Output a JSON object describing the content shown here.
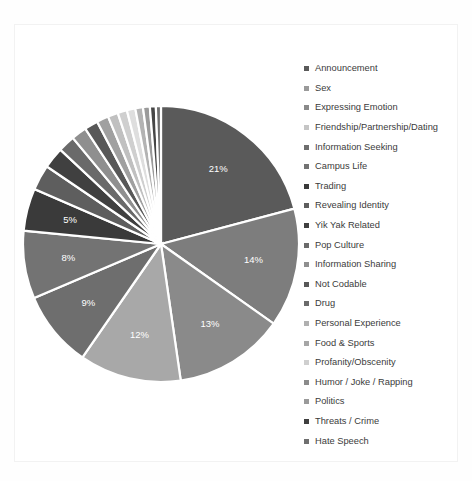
{
  "chart_data": {
    "type": "pie",
    "title": "",
    "xlabel": "",
    "ylabel": "",
    "legend_position": "right",
    "grid": false,
    "start_angle_oclock": 12,
    "direction": "clockwise",
    "label_format": "percent",
    "categories": [
      "Announcement",
      "Sex",
      "Expressing Emotion",
      "Friendship/Partnership/Dating",
      "Information Seeking",
      "Campus Life",
      "Trading",
      "Revealing Identity",
      "Yik Yak Related",
      "Pop Culture",
      "Information Sharing",
      "Not Codable",
      "Drug",
      "Personal Experience",
      "Food & Sports",
      "Profanity/Obscenity",
      "Humor / Joke / Rapping",
      "Politics",
      "Threats / Crime",
      "Hate Speech"
    ],
    "values": [
      21,
      14,
      13,
      12,
      9,
      8,
      5,
      3,
      2.5,
      2,
      1.8,
      1.6,
      1.4,
      1.2,
      1.1,
      1.0,
      0.9,
      0.8,
      0.7,
      0.6
    ],
    "colors": [
      "#5a5a5a",
      "#7d7d7d",
      "#8a8a8a",
      "#a8a8a8",
      "#6e6e6e",
      "#737373",
      "#3a3a3a",
      "#5e5e5e",
      "#404040",
      "#6a6a6a",
      "#8f8f8f",
      "#585858",
      "#a0a0a0",
      "#c0c0c0",
      "#cfcfcf",
      "#dedede",
      "#b3b3b3",
      "#9a9a9a",
      "#464646",
      "#6f6f6f"
    ],
    "visible_labels": [
      {
        "text": "21%",
        "value": 21
      },
      {
        "text": "14%",
        "value": 14
      },
      {
        "text": "13%",
        "value": 13
      },
      {
        "text": "12%",
        "value": 12
      },
      {
        "text": "9%",
        "value": 9
      },
      {
        "text": "8%",
        "value": 8
      },
      {
        "text": "5%",
        "value": 5
      }
    ]
  },
  "legend": {
    "items": [
      {
        "label": "Announcement",
        "color": "#5a5a5a"
      },
      {
        "label": "Sex",
        "color": "#9a9a9a"
      },
      {
        "label": "Expressing Emotion",
        "color": "#8a8a8a"
      },
      {
        "label": "Friendship/Partnership/Dating",
        "color": "#c5c5c5"
      },
      {
        "label": "Information Seeking",
        "color": "#6e6e6e"
      },
      {
        "label": "Campus Life",
        "color": "#737373"
      },
      {
        "label": "Trading",
        "color": "#3a3a3a"
      },
      {
        "label": "Revealing Identity",
        "color": "#5e5e5e"
      },
      {
        "label": "Yik Yak Related",
        "color": "#404040"
      },
      {
        "label": "Pop Culture",
        "color": "#6a6a6a"
      },
      {
        "label": "Information Sharing",
        "color": "#8f8f8f"
      },
      {
        "label": "Not Codable",
        "color": "#585858"
      },
      {
        "label": "Drug",
        "color": "#6b6b6b"
      },
      {
        "label": "Personal Experience",
        "color": "#b0b0b0"
      },
      {
        "label": "Food & Sports",
        "color": "#a6a6a6"
      },
      {
        "label": "Profanity/Obscenity",
        "color": "#cfcfcf"
      },
      {
        "label": "Humor / Joke / Rapping",
        "color": "#8b8b8b"
      },
      {
        "label": "Politics",
        "color": "#9a9a9a"
      },
      {
        "label": "Threats / Crime",
        "color": "#3f3f3f"
      },
      {
        "label": "Hate Speech",
        "color": "#6f6f6f"
      }
    ]
  }
}
